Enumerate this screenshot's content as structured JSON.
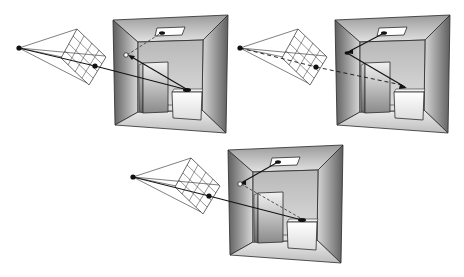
{
  "figure": {
    "colors": {
      "background": "#ffffff",
      "line": "#2a2a2a",
      "wall_dark": "#6e6e6e",
      "wall_light": "#e6e6e6",
      "back_wall": "#c8c8c8",
      "light": "#ffffff"
    },
    "panels": [
      {
        "id": "top-left",
        "x": 0,
        "y": 0,
        "ray_style": "solid",
        "label": ""
      },
      {
        "id": "top-right",
        "x": 222,
        "y": 1,
        "ray_style": "dashed",
        "label": ""
      },
      {
        "id": "bottom",
        "x": 116,
        "y": 128,
        "ray_style": "mixed",
        "label": ""
      }
    ]
  }
}
